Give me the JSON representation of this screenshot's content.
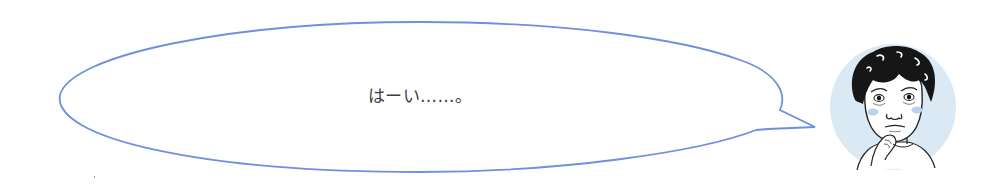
{
  "speech_bubble": {
    "text": "はーい……。",
    "outline_color": "#6f8fe0",
    "fill_color": "#ffffff",
    "text_color": "#3e3e3e"
  },
  "avatar": {
    "icon": "person-thinking-icon",
    "description": "Illustrated man with dark wavy hair, hand on chin, looking unsure",
    "background_color": "#dbe9f4",
    "cheek_color": "#b9d3ee"
  }
}
